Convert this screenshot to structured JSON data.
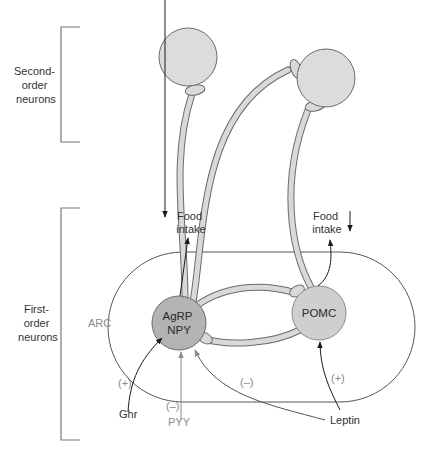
{
  "diagram": {
    "type": "neuronal-circuit",
    "brackets": {
      "second_order": {
        "line1": "Second-",
        "line2": "order",
        "line3": "neurons"
      },
      "first_order": {
        "line1": "First-",
        "line2": "order",
        "line3": "neurons"
      }
    },
    "region": {
      "label": "ARC"
    },
    "neurons": {
      "agrp": {
        "line1": "AgRP",
        "line2": "NPY",
        "fill": "#b3b3b3"
      },
      "pomc": {
        "label": "POMC",
        "fill": "#cfcfcf"
      },
      "second_order_fill": "#dcdcdc"
    },
    "outputs": {
      "left": {
        "line1": "Food",
        "line2": "intake",
        "direction": "up",
        "arrow_glyph": "↑"
      },
      "right": {
        "line1": "Food",
        "line2": "intake",
        "direction": "down",
        "arrow_glyph": "↓"
      }
    },
    "inputs": {
      "ghr": {
        "label": "Ghr",
        "sign": "(+)"
      },
      "pyy": {
        "label": "PYY",
        "sign": "(–)"
      },
      "leptin": {
        "label": "Leptin",
        "sign_agrp": "(–)",
        "sign_pomc": "(+)"
      }
    },
    "colors": {
      "stroke": "#6b6b6b",
      "axon_fill": "#d9d9d9",
      "text": "#333333",
      "gray_text": "#8a8a8a",
      "arrow": "#1a1a1a",
      "gray_arrow": "#8a8a8a"
    }
  }
}
